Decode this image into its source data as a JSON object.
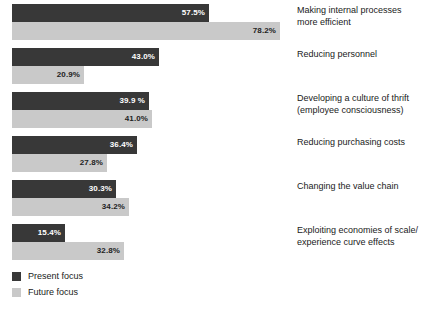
{
  "chart_data": {
    "type": "bar",
    "orientation": "horizontal",
    "title": "",
    "xlabel": "",
    "ylabel": "",
    "xlim": [
      0,
      100
    ],
    "grid": false,
    "legend_position": "bottom-left",
    "categories": [
      "Making internal processes\nmore efficient",
      "Reducing personnel",
      "Developing a culture of thrift\n(employee consciousness)",
      "Reducing purchasing costs",
      "Changing the value chain",
      "Exploiting economies of scale/\nexperience curve effects"
    ],
    "series": [
      {
        "name": "Present focus",
        "color": "#383838",
        "values": [
          57.5,
          43.0,
          39.9,
          36.4,
          30.3,
          15.4
        ],
        "labels": [
          "57.5%",
          "43.0%",
          "39.9 %",
          "36.4%",
          "30.3%",
          "15.4%"
        ]
      },
      {
        "name": "Future focus",
        "color": "#c9c9c9",
        "values": [
          78.2,
          20.9,
          41.0,
          27.8,
          34.2,
          32.8
        ],
        "labels": [
          "78.2%",
          "20.9%",
          "41.0%",
          "27.8%",
          "34.2%",
          "32.8%"
        ]
      }
    ]
  },
  "legend": {
    "items": [
      {
        "label": "Present focus",
        "swatch": "present"
      },
      {
        "label": "Future focus",
        "swatch": "future"
      }
    ]
  }
}
